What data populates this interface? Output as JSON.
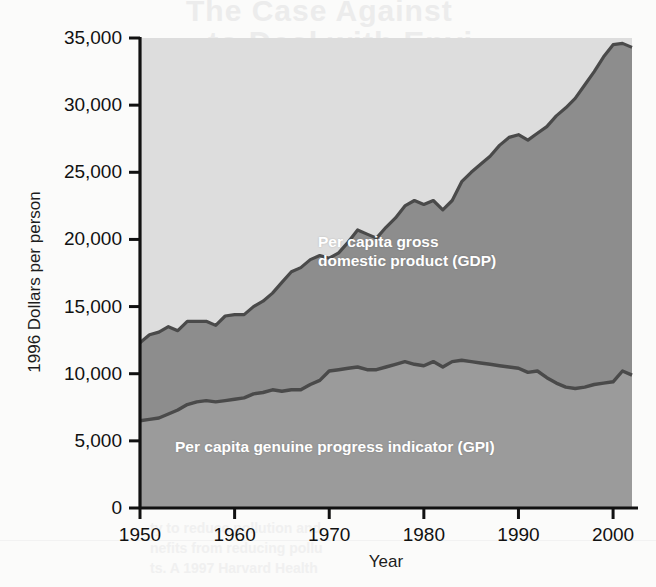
{
  "chart_data": {
    "type": "area",
    "title": "",
    "subtitle": "",
    "xlabel": "Year",
    "ylabel": "1996 Dollars per person",
    "xlim": [
      1950,
      2002
    ],
    "ylim": [
      0,
      35000
    ],
    "grid": false,
    "legend_position": "inline-annotations",
    "stacked": false,
    "fill_style": "band-between-series",
    "colors": {
      "gdp_band": "#8d8d8d",
      "gpi_band": "#9b9b9b",
      "background_band": "#dddddd",
      "line": "#4a4a4a",
      "annotation_text": "#ffffff",
      "axis": "#111111"
    },
    "x": [
      1950,
      1951,
      1952,
      1953,
      1954,
      1955,
      1956,
      1957,
      1958,
      1959,
      1960,
      1961,
      1962,
      1963,
      1964,
      1965,
      1966,
      1967,
      1968,
      1969,
      1970,
      1971,
      1972,
      1973,
      1974,
      1975,
      1976,
      1977,
      1978,
      1979,
      1980,
      1981,
      1982,
      1983,
      1984,
      1985,
      1986,
      1987,
      1988,
      1989,
      1990,
      1991,
      1992,
      1993,
      1994,
      1995,
      1996,
      1997,
      1998,
      1999,
      2000,
      2001,
      2002
    ],
    "series": [
      {
        "name": "Per capita gross domestic product (GDP)",
        "short_name": "GDP",
        "annotation": "Per capita gross domestic product (GDP)",
        "values": [
          12300,
          12900,
          13100,
          13500,
          13200,
          13900,
          13900,
          13900,
          13600,
          14300,
          14400,
          14400,
          15000,
          15400,
          16000,
          16800,
          17600,
          17900,
          18500,
          18800,
          18600,
          19000,
          19800,
          20700,
          20400,
          20100,
          20900,
          21600,
          22500,
          22900,
          22600,
          22900,
          22200,
          22900,
          24300,
          25000,
          25600,
          26200,
          27000,
          27600,
          27800,
          27400,
          27900,
          28400,
          29200,
          29800,
          30500,
          31500,
          32500,
          33600,
          34500,
          34600,
          34300
        ]
      },
      {
        "name": "Per capita genuine progress indicator (GPI)",
        "short_name": "GPI",
        "annotation": "Per capita genuine progress indicator (GPI)",
        "values": [
          6500,
          6600,
          6700,
          7000,
          7300,
          7700,
          7900,
          8000,
          7900,
          8000,
          8100,
          8200,
          8500,
          8600,
          8800,
          8700,
          8800,
          8800,
          9200,
          9500,
          10200,
          10300,
          10400,
          10500,
          10300,
          10300,
          10500,
          10700,
          10900,
          10700,
          10600,
          10900,
          10500,
          10900,
          11000,
          10900,
          10800,
          10700,
          10600,
          10500,
          10400,
          10100,
          10200,
          9700,
          9300,
          9000,
          8900,
          9000,
          9200,
          9300,
          9400,
          10200,
          9900
        ]
      }
    ],
    "y_ticks": [
      0,
      5000,
      10000,
      15000,
      20000,
      25000,
      30000,
      35000
    ],
    "y_tick_labels": [
      "0",
      "5,000",
      "10,000",
      "15,000",
      "20,000",
      "25,000",
      "30,000",
      "35,000"
    ],
    "x_ticks": [
      1950,
      1960,
      1970,
      1980,
      1990,
      2000
    ],
    "x_tick_labels": [
      "1950",
      "1960",
      "1970",
      "1980",
      "1990",
      "2000"
    ]
  },
  "bleed_through": {
    "title_line_1": "The Case Against",
    "title_line_2": "to Deal with Envi",
    "body": [
      "Environmental degradat",
      "and other government pro",
      "mental quality. The spe",
      "and regulations in the",
      "regulated market econ"
    ],
    "bottom": [
      "ty to reduce pollution and",
      "nefits from reducing pollu",
      "ts. A 1997 Harvard Health"
    ]
  }
}
